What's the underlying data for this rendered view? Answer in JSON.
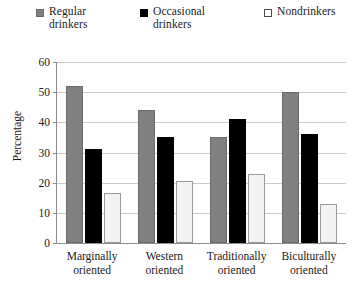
{
  "chart_data": {
    "type": "bar",
    "title": "",
    "xlabel": "",
    "ylabel": "Percentage",
    "ylim": [
      0,
      60
    ],
    "yticks": [
      0,
      10,
      20,
      30,
      40,
      50,
      60
    ],
    "grid": "horizontal",
    "legend_position": "top",
    "categories": [
      "Marginally\noriented",
      "Western\noriented",
      "Traditionally\noriented",
      "Biculturally\noriented"
    ],
    "series": [
      {
        "name": "Regular\ndrinkers",
        "legend_label": "Regular\ndrinkers",
        "color": "#808080",
        "swatch": "sw-regular",
        "values": [
          52,
          44,
          35,
          50
        ]
      },
      {
        "name": "Occasional\ndrinkers",
        "legend_label": "Occasional\ndrinkers",
        "color": "#000000",
        "swatch": "sw-occasional",
        "values": [
          31,
          35,
          41,
          36
        ]
      },
      {
        "name": "Nondrinkers",
        "legend_label": "Nondrinkers",
        "color": "#ffffff",
        "swatch": "sw-nondrinker",
        "values": [
          16.5,
          20.5,
          23,
          13
        ]
      }
    ]
  },
  "axis": {
    "y_title": "Percentage",
    "y_tick_labels": [
      "0",
      "10",
      "20",
      "30",
      "40",
      "50",
      "60"
    ]
  },
  "colors": {
    "regular": "#808080",
    "occasional": "#000000",
    "nondrinkers": "#f2f2f2",
    "gridline": "#c9c9c9",
    "axis": "#8c8c8c"
  }
}
